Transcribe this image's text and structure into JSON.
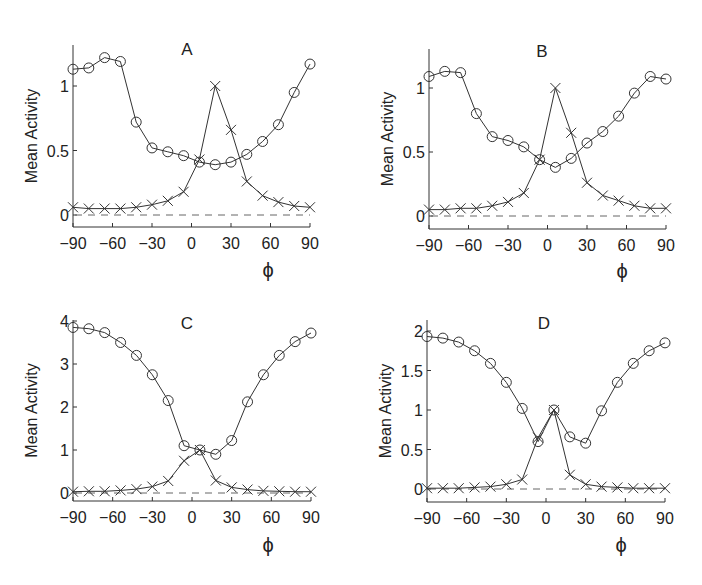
{
  "figure": {
    "ylabel": "Mean Activity",
    "xlabel": "ϕ",
    "xticks": [
      -90,
      -60,
      -30,
      0,
      30,
      60,
      90
    ]
  },
  "chart_data": [
    {
      "type": "line",
      "title": "A",
      "xlabel": "ϕ",
      "ylabel": "Mean Activity",
      "x": [
        -90,
        -78,
        -66,
        -54,
        -42,
        -30,
        -18,
        -6,
        6,
        18,
        30,
        42,
        54,
        66,
        78,
        90
      ],
      "xlim": [
        -90,
        90
      ],
      "ylim": [
        -0.03,
        1.3
      ],
      "yticks": [
        0,
        0.5,
        1
      ],
      "ytick_labels": [
        "0",
        "0.5",
        "1"
      ],
      "xticks": [
        -90,
        -60,
        -30,
        0,
        30,
        60,
        90
      ],
      "reference_line": {
        "y": 0,
        "style": "dashed"
      },
      "series": [
        {
          "name": "circles",
          "marker": "o",
          "values": [
            1.13,
            1.14,
            1.22,
            1.19,
            0.72,
            0.52,
            0.49,
            0.46,
            0.41,
            0.39,
            0.41,
            0.47,
            0.57,
            0.7,
            0.95,
            1.17
          ]
        },
        {
          "name": "crosses",
          "marker": "x",
          "values": [
            0.06,
            0.05,
            0.05,
            0.05,
            0.06,
            0.08,
            0.11,
            0.18,
            0.43,
            1.0,
            0.66,
            0.26,
            0.15,
            0.1,
            0.07,
            0.06
          ]
        }
      ],
      "layout": {
        "ox": 73,
        "ow": 237,
        "y0px": 215,
        "unitpx": 129,
        "top": 45,
        "bottom": 227,
        "title_x": 187,
        "title_y": 55,
        "phi_x": 268,
        "phi_y": 277
      }
    },
    {
      "type": "line",
      "title": "B",
      "xlabel": "ϕ",
      "ylabel": "Mean Activity",
      "x": [
        -90,
        -78,
        -66,
        -54,
        -42,
        -30,
        -18,
        -6,
        6,
        18,
        30,
        42,
        54,
        66,
        78,
        90
      ],
      "xlim": [
        -90,
        90
      ],
      "ylim": [
        -0.03,
        1.3
      ],
      "yticks": [
        0,
        0.5,
        1
      ],
      "ytick_labels": [
        "0",
        "0.5",
        "1"
      ],
      "xticks": [
        -90,
        -60,
        -30,
        0,
        30,
        60,
        90
      ],
      "reference_line": {
        "y": 0,
        "style": "dashed"
      },
      "series": [
        {
          "name": "circles",
          "marker": "o",
          "values": [
            1.09,
            1.13,
            1.12,
            0.8,
            0.62,
            0.59,
            0.54,
            0.44,
            0.38,
            0.45,
            0.57,
            0.66,
            0.78,
            0.96,
            1.09,
            1.07
          ]
        },
        {
          "name": "crosses",
          "marker": "x",
          "values": [
            0.05,
            0.05,
            0.06,
            0.06,
            0.08,
            0.11,
            0.18,
            0.44,
            1.0,
            0.65,
            0.26,
            0.16,
            0.12,
            0.08,
            0.06,
            0.06
          ]
        }
      ],
      "layout": {
        "ox": 429,
        "ow": 237,
        "y0px": 216,
        "unitpx": 128,
        "top": 49,
        "bottom": 229,
        "title_x": 542,
        "title_y": 57,
        "phi_x": 622,
        "phi_y": 278
      }
    },
    {
      "type": "line",
      "title": "C",
      "xlabel": "ϕ",
      "ylabel": "Mean Activity",
      "x": [
        -90,
        -78,
        -66,
        -54,
        -42,
        -30,
        -18,
        -6,
        6,
        18,
        30,
        42,
        54,
        66,
        78,
        90
      ],
      "xlim": [
        -90,
        90
      ],
      "ylim": [
        -0.2,
        4
      ],
      "yticks": [
        0,
        1,
        2,
        3,
        4
      ],
      "ytick_labels": [
        "0",
        "1",
        "2",
        "3",
        "4"
      ],
      "xticks": [
        -90,
        -60,
        -30,
        0,
        30,
        60,
        90
      ],
      "reference_line": {
        "y": 0,
        "style": "dashed"
      },
      "series": [
        {
          "name": "circles",
          "marker": "o",
          "values": [
            3.85,
            3.82,
            3.73,
            3.5,
            3.2,
            2.75,
            2.15,
            1.1,
            1.0,
            0.9,
            1.22,
            2.12,
            2.75,
            3.2,
            3.52,
            3.72
          ]
        },
        {
          "name": "crosses",
          "marker": "x",
          "values": [
            0.03,
            0.04,
            0.04,
            0.06,
            0.09,
            0.15,
            0.28,
            0.75,
            1.0,
            0.29,
            0.13,
            0.08,
            0.05,
            0.04,
            0.03,
            0.03
          ]
        }
      ],
      "layout": {
        "ox": 73,
        "ow": 238,
        "y0px": 493,
        "unitpx": 43,
        "top": 320,
        "bottom": 501,
        "title_x": 187,
        "title_y": 329,
        "phi_x": 268,
        "phi_y": 552
      }
    },
    {
      "type": "line",
      "title": "D",
      "xlabel": "ϕ",
      "ylabel": "Mean Activity",
      "x": [
        -90,
        -78,
        -66,
        -54,
        -42,
        -30,
        -18,
        -6,
        6,
        18,
        30,
        42,
        54,
        66,
        78,
        90
      ],
      "xlim": [
        -90,
        90
      ],
      "ylim": [
        -0.15,
        2.05
      ],
      "yticks": [
        0,
        0.5,
        1,
        1.5,
        2
      ],
      "ytick_labels": [
        "0",
        "0.5",
        "1",
        "1.5",
        "2"
      ],
      "xticks": [
        -90,
        -60,
        -30,
        0,
        30,
        60,
        90
      ],
      "reference_line": {
        "y": 0,
        "style": "dashed"
      },
      "series": [
        {
          "name": "circles",
          "marker": "o",
          "values": [
            1.93,
            1.91,
            1.86,
            1.75,
            1.59,
            1.35,
            1.02,
            0.6,
            1.0,
            0.66,
            0.58,
            0.99,
            1.35,
            1.59,
            1.75,
            1.85
          ]
        },
        {
          "name": "crosses",
          "marker": "x",
          "values": [
            0.01,
            0.01,
            0.01,
            0.02,
            0.03,
            0.06,
            0.12,
            0.65,
            1.0,
            0.18,
            0.06,
            0.03,
            0.02,
            0.01,
            0.01,
            0.01
          ]
        }
      ],
      "layout": {
        "ox": 427,
        "ow": 238,
        "y0px": 489,
        "unitpx": 79,
        "top": 320,
        "bottom": 502,
        "title_x": 544,
        "title_y": 329,
        "phi_x": 621,
        "phi_y": 552
      }
    }
  ]
}
